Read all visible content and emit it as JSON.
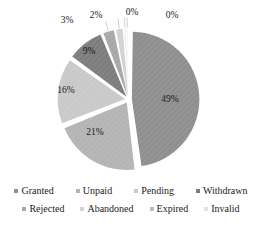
{
  "chart_data": {
    "type": "pie",
    "title": "",
    "subtitle": "",
    "xlabel": "",
    "ylabel": "",
    "grid": false,
    "legend_position": "bottom",
    "legend_columns": 4,
    "categories": [
      "Granted",
      "Unpaid",
      "Pending",
      "Withdrawn",
      "Rejected",
      "Abandoned",
      "Expired",
      "Invalid"
    ],
    "values": [
      49,
      21,
      16,
      9,
      3,
      2,
      0,
      0
    ],
    "data_labels": [
      "49%",
      "21%",
      "16%",
      "9%",
      "3%",
      "2%",
      "0%",
      "0%"
    ],
    "colors": [
      "#8f8f8f",
      "#b4b4b4",
      "#c9c9c9",
      "#7d7d7d",
      "#a8a8a8",
      "#d2d2d2",
      "#bdbdbd",
      "#e2e2e2"
    ],
    "slices": [
      {
        "label": "Granted",
        "value": 49,
        "data_label": "49%",
        "color": "#8f8f8f",
        "exploded": true,
        "callout": false
      },
      {
        "label": "Unpaid",
        "value": 21,
        "data_label": "21%",
        "color": "#b4b4b4",
        "exploded": true,
        "callout": false
      },
      {
        "label": "Pending",
        "value": 16,
        "data_label": "16%",
        "color": "#c9c9c9",
        "exploded": true,
        "callout": false
      },
      {
        "label": "Withdrawn",
        "value": 9,
        "data_label": "9%",
        "color": "#7d7d7d",
        "exploded": true,
        "callout": false
      },
      {
        "label": "Rejected",
        "value": 3,
        "data_label": "3%",
        "color": "#a8a8a8",
        "exploded": true,
        "callout": true
      },
      {
        "label": "Abandoned",
        "value": 2,
        "data_label": "2%",
        "color": "#d2d2d2",
        "exploded": true,
        "callout": true
      },
      {
        "label": "Expired",
        "value": 0,
        "data_label": "0%",
        "color": "#bdbdbd",
        "exploded": true,
        "callout": true
      },
      {
        "label": "Invalid",
        "value": 0,
        "data_label": "0%",
        "color": "#e2e2e2",
        "exploded": true,
        "callout": true
      }
    ]
  },
  "legend": {
    "rows": [
      [
        {
          "label": "Granted",
          "color": "#8f8f8f"
        },
        {
          "label": "Unpaid",
          "color": "#b4b4b4"
        },
        {
          "label": "Pending",
          "color": "#c9c9c9"
        },
        {
          "label": "Withdrawn",
          "color": "#7d7d7d"
        }
      ],
      [
        {
          "label": "Rejected",
          "color": "#a8a8a8"
        },
        {
          "label": "Abandoned",
          "color": "#d2d2d2"
        },
        {
          "label": "Expired",
          "color": "#bdbdbd"
        },
        {
          "label": "Invalid",
          "color": "#e2e2e2"
        }
      ]
    ]
  },
  "labels": {
    "granted_pct": "49%",
    "unpaid_pct": "21%",
    "pending_pct": "16%",
    "withdrawn_pct": "9%",
    "rejected_pct": "3%",
    "abandoned_pct": "2%",
    "expired_pct": "0%",
    "invalid_pct": "0%"
  }
}
